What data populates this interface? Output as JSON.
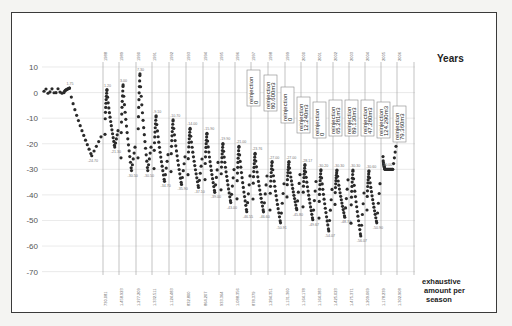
{
  "chart_data": {
    "type": "scatter",
    "title": "",
    "xlabel": "exhaustive amount per season",
    "ylabel": "",
    "ylim": [
      -70,
      10
    ],
    "yticks": [
      10,
      0,
      -10,
      -20,
      -30,
      -40,
      -50,
      -60,
      -70
    ],
    "top_axis_label": "Years",
    "years": [
      "1988",
      "1989",
      "1990",
      "1991",
      "1992",
      "1993",
      "1994",
      "1995",
      "1996",
      "1997",
      "1998",
      "1999",
      "2000",
      "2001",
      "2002",
      "2003",
      "2004",
      "2005",
      "2006"
    ],
    "exhaustive_amounts": [
      "730.081",
      "1.458.923",
      "1.277.209",
      "1.332.511",
      "1.124.483",
      "832.800",
      "864.207",
      "933.364",
      "1.088.356",
      "878.379",
      "1.294.351",
      "1.131.360",
      "1.164.178",
      "1.164.383",
      "1.425.023",
      "1.475.371",
      "1.209.069",
      "1.178.239",
      "1.302.908"
    ],
    "peaks": [
      {
        "season": "pre-1988",
        "value": 1.75
      },
      {
        "season": "1988",
        "value": 1.2
      },
      {
        "season": "1989",
        "value": 3.0
      },
      {
        "season": "1990",
        "value": 7.3
      },
      {
        "season": "1991",
        "value": 9.1
      },
      {
        "season": "1992",
        "value": 10.7
      },
      {
        "season": "1993",
        "value": 14.0
      },
      {
        "season": "1994",
        "value": 15.9
      },
      {
        "season": "1995",
        "value": 19.9
      },
      {
        "season": "1996",
        "value": 21.0
      },
      {
        "season": "1997",
        "value": 23.76
      },
      {
        "season": "1998",
        "value": 27.0
      },
      {
        "season": "1999",
        "value": 27.0
      },
      {
        "season": "2000",
        "value": 28.17
      },
      {
        "season": "2001",
        "value": 30.2
      },
      {
        "season": "2002",
        "value": 30.3
      },
      {
        "season": "2003",
        "value": 30.3
      },
      {
        "season": "2004",
        "value": 30.6
      },
      {
        "season": "2005",
        "value": 30.0
      }
    ],
    "minima": [
      {
        "season": "pre-1988",
        "value": -24.7
      },
      {
        "season": "1988",
        "value": -21.3
      },
      {
        "season": "1989",
        "value": -30.5
      },
      {
        "season": "1990",
        "value": -30.5
      },
      {
        "season": "1991",
        "value": -34.7
      },
      {
        "season": "1992",
        "value": -35.9
      },
      {
        "season": "1993",
        "value": -37.1
      },
      {
        "season": "1994",
        "value": -39.0
      },
      {
        "season": "1995",
        "value": -43.0
      },
      {
        "season": "1996",
        "value": -46.55
      },
      {
        "season": "1997",
        "value": -46.6
      },
      {
        "season": "1998",
        "value": -50.91
      },
      {
        "season": "1999",
        "value": -45.8
      },
      {
        "season": "2000",
        "value": -49.67
      },
      {
        "season": "2001",
        "value": -54.07
      },
      {
        "season": "2002",
        "value": -48.74
      },
      {
        "season": "2003",
        "value": -56.07
      },
      {
        "season": "2004",
        "value": -50.9
      }
    ],
    "annotations": [
      {
        "text": "reinjection\n0",
        "year": "1996"
      },
      {
        "text": "reinjection\n80.600m3",
        "year": "1997"
      },
      {
        "text": "reinjection\n0",
        "year": "1998"
      },
      {
        "text": "reinjection\n12.240m3",
        "year": "1999"
      },
      {
        "text": "reinjection\n0",
        "year": "2000"
      },
      {
        "text": "reinjection\n65.281m3",
        "year": "2001"
      },
      {
        "text": "reinjection\n89.130m3",
        "year": "2002"
      },
      {
        "text": "reinjection\n47.280m3",
        "year": "2003"
      },
      {
        "text": "reinjection\n124.290m3",
        "year": "2004"
      },
      {
        "text": "reinjection\n79.360m3",
        "year": "2005"
      }
    ],
    "grid": true,
    "marker_color": "#2a2a2a"
  },
  "labels": {
    "years_title": "Years",
    "bottom_title_line1": "exhaustive",
    "bottom_title_line2": "amount per",
    "bottom_title_line3": "season"
  }
}
